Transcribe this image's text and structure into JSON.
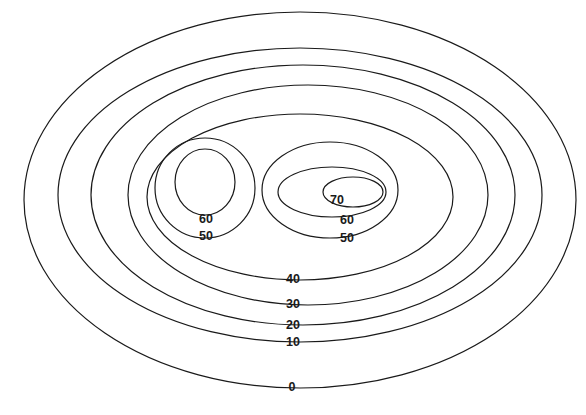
{
  "chart_data": {
    "type": "contour",
    "title": "",
    "xlabel": "",
    "ylabel": "",
    "grid": false,
    "legend": null,
    "levels": [
      0,
      10,
      20,
      30,
      40,
      50,
      60,
      70
    ],
    "peaks": [
      {
        "name": "left-peak",
        "max_level": 60
      },
      {
        "name": "right-peak",
        "max_level": 70
      }
    ],
    "contours": [
      {
        "level": 0,
        "label": "0",
        "cx": 300,
        "cy": 200,
        "rx": 276,
        "ry": 188,
        "label_x": 292,
        "label_y": 387
      },
      {
        "level": 10,
        "label": "10",
        "cx": 300,
        "cy": 195,
        "rx": 242,
        "ry": 147,
        "label_x": 293,
        "label_y": 342
      },
      {
        "level": 20,
        "label": "20",
        "cx": 303,
        "cy": 195,
        "rx": 212,
        "ry": 130,
        "label_x": 293,
        "label_y": 325
      },
      {
        "level": 30,
        "label": "30",
        "cx": 308,
        "cy": 195,
        "rx": 180,
        "ry": 110,
        "label_x": 293,
        "label_y": 304
      },
      {
        "level": 40,
        "label": "40",
        "cx": 300,
        "cy": 197,
        "rx": 153,
        "ry": 83,
        "label_x": 293,
        "label_y": 279
      },
      {
        "level": 50,
        "label": "50",
        "cx": 205,
        "cy": 188,
        "rx": 50,
        "ry": 50,
        "label_x": 206,
        "label_y": 236
      },
      {
        "level": 60,
        "label": "60",
        "cx": 205,
        "cy": 182,
        "rx": 30,
        "ry": 33,
        "label_x": 206,
        "label_y": 219
      },
      {
        "level": 50,
        "label": "50",
        "cx": 330,
        "cy": 190,
        "rx": 68,
        "ry": 48,
        "label_x": 347,
        "label_y": 238
      },
      {
        "level": 60,
        "label": "60",
        "cx": 332,
        "cy": 192,
        "rx": 54,
        "ry": 25,
        "label_x": 347,
        "label_y": 220
      },
      {
        "level": 70,
        "label": "70",
        "cx": 353,
        "cy": 192,
        "rx": 30,
        "ry": 15,
        "label_x": 337,
        "label_y": 200
      }
    ]
  }
}
